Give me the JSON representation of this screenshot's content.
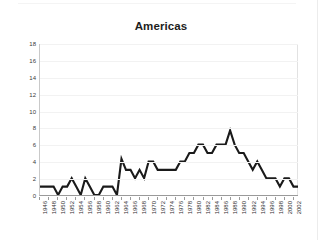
{
  "chart_data": {
    "type": "line",
    "title": "Americas",
    "xlabel": "",
    "ylabel": "",
    "xlim": [
      1946,
      2003
    ],
    "ylim": [
      0,
      18
    ],
    "ytick_step": 2,
    "xtick_step": 2,
    "grid": true,
    "legend": "none",
    "line_color": "#1a1a1a",
    "background_color": "#ffffff",
    "yticks": [
      0,
      2,
      4,
      6,
      8,
      10,
      12,
      14,
      16,
      18
    ],
    "xticks": [
      1946,
      1948,
      1950,
      1952,
      1954,
      1956,
      1958,
      1960,
      1962,
      1964,
      1966,
      1968,
      1970,
      1972,
      1974,
      1976,
      1978,
      1980,
      1982,
      1984,
      1986,
      1988,
      1990,
      1992,
      1994,
      1996,
      1998,
      2000,
      2002
    ],
    "x": [
      1946,
      1947,
      1948,
      1949,
      1950,
      1951,
      1952,
      1953,
      1954,
      1955,
      1956,
      1957,
      1958,
      1959,
      1960,
      1961,
      1962,
      1963,
      1964,
      1965,
      1966,
      1967,
      1968,
      1969,
      1970,
      1971,
      1972,
      1973,
      1974,
      1975,
      1976,
      1977,
      1978,
      1979,
      1980,
      1981,
      1982,
      1983,
      1984,
      1985,
      1986,
      1987,
      1988,
      1989,
      1990,
      1991,
      1992,
      1993,
      1994,
      1995,
      1996,
      1997,
      1998,
      1999,
      2000,
      2001,
      2002,
      2003
    ],
    "values": [
      1,
      1,
      1,
      1,
      0,
      1,
      1,
      2,
      1,
      0,
      2,
      1,
      0,
      0,
      1,
      1,
      1,
      0,
      4.3,
      3,
      3,
      2,
      3,
      2,
      4,
      4,
      3,
      3,
      3,
      3,
      3,
      4,
      4,
      5,
      5,
      6,
      6,
      5,
      5,
      6,
      6,
      6,
      7.7,
      6,
      5,
      5,
      4,
      3,
      4,
      3,
      2,
      2,
      2,
      1,
      2,
      2,
      1,
      1
    ],
    "series_name": "Americas"
  },
  "title": {
    "text": "Americas"
  }
}
